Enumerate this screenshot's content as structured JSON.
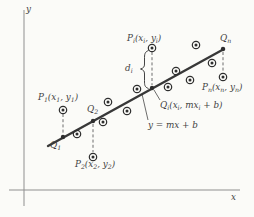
{
  "figure": {
    "background_color": "#fbfbf8",
    "ink_color": "#2e2e2e",
    "axis_color": "#8f8f8f",
    "dash_color": "#4a4a4a",
    "line_color": "#383838",
    "text_color": "#3f3f3f",
    "line_equation": "y = mx + b",
    "axes": {
      "y_axis": {
        "x": 24,
        "y_top": 10,
        "y_bottom": 206
      },
      "x_axis": {
        "y": 190,
        "x_left": 9,
        "x_right": 240
      }
    },
    "regression_line": {
      "x1": 48,
      "y1": 146,
      "x2": 224,
      "y2": 49,
      "width": 2.4
    },
    "scatter_points": [
      [
        63,
        110
      ],
      [
        77,
        134
      ],
      [
        93,
        157
      ],
      [
        103,
        122
      ],
      [
        108,
        102
      ],
      [
        127,
        111
      ],
      [
        137,
        89
      ],
      [
        152,
        48
      ],
      [
        168,
        87
      ],
      [
        176,
        71
      ],
      [
        190,
        80
      ],
      [
        196,
        45
      ],
      [
        212,
        63
      ],
      [
        223,
        77
      ]
    ],
    "line_points": [
      [
        63,
        137
      ],
      [
        93,
        121
      ],
      [
        152,
        88
      ],
      [
        223,
        49
      ]
    ],
    "residual_segments": [
      [
        63,
        114,
        63,
        134
      ],
      [
        93,
        124,
        93,
        152
      ],
      [
        152,
        52,
        152,
        85
      ],
      [
        223,
        52,
        223,
        72
      ]
    ],
    "pointer_lines": [
      [
        154,
        90,
        160,
        100
      ],
      [
        142,
        94,
        148,
        120
      ]
    ],
    "brace": {
      "x_end": 148.5,
      "x_body": 144.5,
      "x_tip": 140.5,
      "y_top": 50.5,
      "y_mid": 69,
      "y_bottom": 88.5
    },
    "labels": [
      {
        "name": "y-axis-label",
        "text": "y",
        "x": 26,
        "y": 12
      },
      {
        "name": "x-axis-label",
        "text": "x",
        "x": 231,
        "y": 200
      },
      {
        "name": "p1-label",
        "text": "P_1(x_1, y_1)",
        "x": 38,
        "y": 100
      },
      {
        "name": "q1-label",
        "text": "Q_1",
        "x": 50,
        "y": 148
      },
      {
        "name": "p2-label",
        "text": "P_2(x_2, y_2)",
        "x": 75,
        "y": 167
      },
      {
        "name": "q2-label",
        "text": "Q_2",
        "x": 87,
        "y": 112
      },
      {
        "name": "pi-label",
        "text": "P_i(x_i, y_i)",
        "x": 127,
        "y": 41
      },
      {
        "name": "di-label",
        "text": "d_i",
        "x": 125,
        "y": 71
      },
      {
        "name": "qi-label",
        "text": "Q_i(x_i, mx_i + b)",
        "x": 160,
        "y": 108
      },
      {
        "name": "equation-label",
        "text": "y = mx + b",
        "x": 148,
        "y": 128
      },
      {
        "name": "qn-label",
        "text": "Q_n",
        "x": 220,
        "y": 41
      },
      {
        "name": "pn-label",
        "text": "P_n(x_n, y_n)",
        "x": 202,
        "y": 90
      }
    ],
    "point_style": {
      "scatter_outer_radius": 3.7,
      "scatter_inner_radius": 1.5,
      "line_point_radius": 2.2,
      "font_size": 8.8,
      "subscript_size": 6.2
    }
  }
}
